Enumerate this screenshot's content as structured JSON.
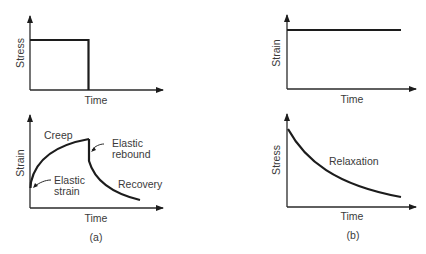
{
  "figure": {
    "panel_a": {
      "caption": "(a)",
      "top": {
        "ylabel": "Stress",
        "xlabel": "Time",
        "description": "Constant stress applied, then removed"
      },
      "bottom": {
        "ylabel": "Strain",
        "xlabel": "Time",
        "annotations": {
          "creep": "Creep",
          "elastic_rebound_1": "Elastic",
          "elastic_rebound_2": "rebound",
          "elastic_strain_1": "Elastic",
          "elastic_strain_2": "strain",
          "recovery": "Recovery"
        }
      }
    },
    "panel_b": {
      "caption": "(b)",
      "top": {
        "ylabel": "Strain",
        "xlabel": "Time",
        "description": "Constant strain held"
      },
      "bottom": {
        "ylabel": "Stress",
        "xlabel": "Time",
        "annotations": {
          "relaxation": "Relaxation"
        }
      }
    }
  },
  "colors": {
    "line": "#1c1c1c",
    "text": "#3a3a3a",
    "background": "#ffffff"
  }
}
